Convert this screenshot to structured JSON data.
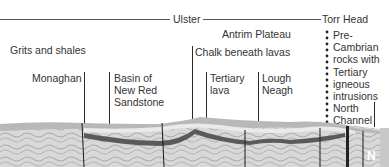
{
  "diagram": {
    "type": "geological cross-section",
    "palette": {
      "background": "#ffffff",
      "text": "#333333",
      "leader_line": "#2a2a2a",
      "surface_layer": "#b8b8b8",
      "chalk_band": "#e6e6e6",
      "dark_band": "#5a5a5a",
      "folded_rock": "#d4d4d4",
      "fold_lines": "#9a9a9a"
    },
    "regions": {
      "ulster": "Ulster",
      "torr_head": "Torr Head"
    },
    "labels": {
      "grits_and_shales": "Grits and shales",
      "monaghan": "Monaghan",
      "basin_new_red_sandstone": "Basin of\nNew Red\nSandstone",
      "antrim_plateau": "Antrim Plateau",
      "chalk_beneath_lavas": "Chalk beneath lavas",
      "tertiary_lava": "Tertiary\nlava",
      "lough_neagh": "Lough\nNeagh",
      "precambrian": "Pre-\nCambrian\nrocks with\nTertiary\nigneous\nintrusions",
      "north_channel": "North\nChannel",
      "compass": "N"
    }
  }
}
